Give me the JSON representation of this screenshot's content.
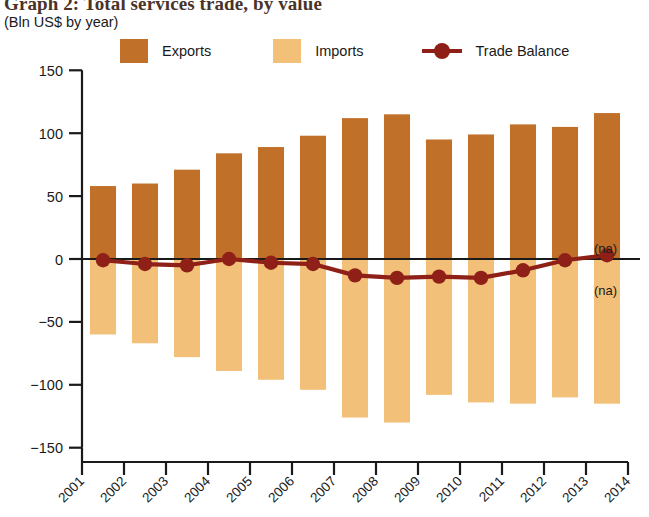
{
  "title": "Graph 2: Total services trade, by value",
  "subtitle": "(Bln US$ by year)",
  "legend": {
    "exports_label": "Exports",
    "imports_label": "Imports",
    "balance_label": "Trade Balance"
  },
  "colors": {
    "exports": "#C1702A",
    "imports": "#F2C078",
    "balance": "#8E2018",
    "axis": "#1a1a1a",
    "title": "#4a3328"
  },
  "annotations": {
    "na_upper": "(na)",
    "na_lower": "(na)"
  },
  "chart_data": {
    "type": "bar",
    "title": "Graph 2: Total services trade, by value",
    "subtitle": "(Bln US$ by year)",
    "xlabel": "",
    "ylabel": "Bln US$",
    "ylim": [
      -150,
      150
    ],
    "yticks": [
      150,
      100,
      50,
      0,
      -50,
      -100,
      -150
    ],
    "ytick_labels": [
      "150",
      "100",
      "50",
      "0",
      "−50",
      "−100",
      "−150"
    ],
    "xticks": [
      "2001",
      "2002",
      "2003",
      "2004",
      "2005",
      "2006",
      "2007",
      "2008",
      "2009",
      "2010",
      "2011",
      "2012",
      "2013",
      "2014"
    ],
    "categories": [
      "2001",
      "2002",
      "2003",
      "2004",
      "2005",
      "2006",
      "2007",
      "2008",
      "2009",
      "2010",
      "2011",
      "2012",
      "2013"
    ],
    "grid": false,
    "legend_position": "top",
    "series": [
      {
        "name": "Exports",
        "type": "bar",
        "color": "#C1702A",
        "values": [
          58,
          60,
          71,
          84,
          89,
          98,
          112,
          115,
          95,
          99,
          107,
          105,
          116
        ]
      },
      {
        "name": "Imports",
        "type": "bar",
        "color": "#F2C078",
        "values": [
          -60,
          -67,
          -78,
          -89,
          -96,
          -104,
          -126,
          -130,
          -108,
          -114,
          -115,
          -110,
          -115
        ]
      },
      {
        "name": "Trade Balance",
        "type": "line",
        "color": "#8E2018",
        "values": [
          -1,
          -4,
          -5,
          0,
          -3,
          -4,
          -13,
          -15,
          -14,
          -15,
          -9,
          -1,
          3
        ]
      }
    ]
  }
}
